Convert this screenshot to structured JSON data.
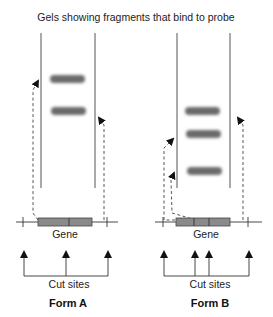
{
  "title": "Gels showing fragments that bind to probe",
  "form_a": {
    "label": "Form A",
    "gene_label": "Gene",
    "cut_sites_label": "Cut sites",
    "band_count": 2,
    "cut_site_count": 3
  },
  "form_b": {
    "label": "Form B",
    "gene_label": "Gene",
    "cut_sites_label": "Cut sites",
    "band_count": 3,
    "cut_site_count": 4
  },
  "colors": {
    "band": "#6b6b6b",
    "gene": "#8a8a8a",
    "line": "#333333"
  }
}
